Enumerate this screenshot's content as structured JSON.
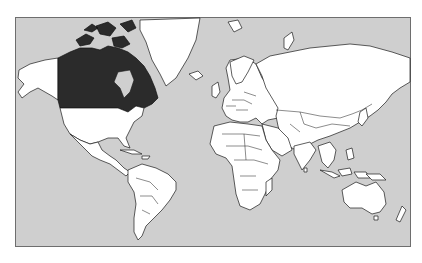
{
  "map": {
    "type": "world-political-outline",
    "projection": "Mercator",
    "highlighted_country": "Canada",
    "colors": {
      "ocean": "#cfcfcf",
      "land": "#ffffff",
      "highlight": "#2b2b2b",
      "border": "#1a1a1a",
      "frame": "#6e6e6e"
    },
    "regions": [
      "North America",
      "Greenland",
      "Central America",
      "Caribbean",
      "South America",
      "Europe",
      "Africa",
      "Madagascar",
      "Middle East",
      "Russia",
      "Asia",
      "India",
      "Japan",
      "Southeast Asia",
      "Indonesia",
      "Australia",
      "New Zealand",
      "Svalbard",
      "Novaya Zemlya"
    ]
  }
}
